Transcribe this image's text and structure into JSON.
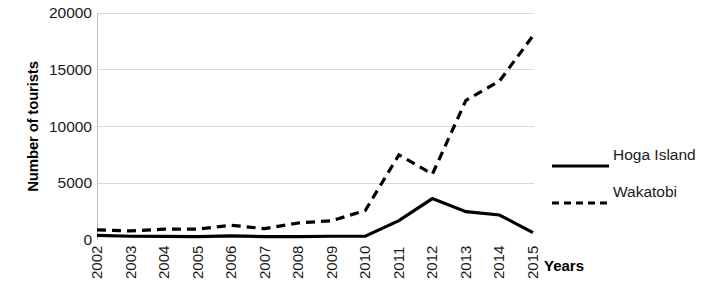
{
  "chart_data": {
    "type": "line",
    "title": "",
    "xlabel": "Years",
    "ylabel": "Number of tourists",
    "categories": [
      "2002",
      "2003",
      "2004",
      "2005",
      "2006",
      "2007",
      "2008",
      "2009",
      "2010",
      "2011",
      "2012",
      "2013",
      "2014",
      "2015"
    ],
    "x": [
      2002,
      2003,
      2004,
      2005,
      2006,
      2007,
      2008,
      2009,
      2010,
      2011,
      2012,
      2013,
      2014,
      2015
    ],
    "ylim": [
      0,
      20000
    ],
    "xlim": [
      2002,
      2015
    ],
    "yticks": [
      0,
      5000,
      10000,
      15000,
      20000
    ],
    "ytick_labels": [
      "0",
      "5000",
      "10000",
      "15000",
      "20000"
    ],
    "grid": true,
    "grid_axis": "y",
    "legend_position": "right",
    "series": [
      {
        "name": "Hoga Island",
        "style": "solid",
        "color": "#000000",
        "values": [
          400,
          330,
          320,
          300,
          370,
          300,
          300,
          330,
          330,
          1700,
          3650,
          2500,
          2200,
          650
        ]
      },
      {
        "name": "Wakatobi",
        "style": "dashed",
        "color": "#000000",
        "values": [
          900,
          800,
          950,
          950,
          1300,
          1000,
          1500,
          1700,
          2600,
          7500,
          5800,
          12300,
          14000,
          18000
        ]
      }
    ]
  },
  "axes": {
    "y_title": "Number of tourists",
    "x_title": "Years"
  },
  "legend": {
    "items": [
      {
        "label": "Hoga Island",
        "style": "solid"
      },
      {
        "label": "Wakatobi",
        "style": "dashed"
      }
    ]
  },
  "colors": {
    "line": "#000000",
    "grid": "#d9d9d9",
    "axis": "#bfbfbf",
    "text": "#1a1a1a",
    "background": "#ffffff"
  }
}
